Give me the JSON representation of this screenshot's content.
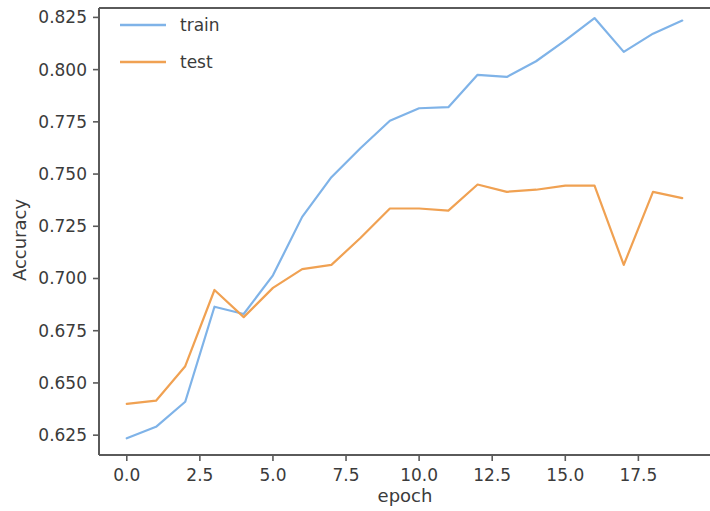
{
  "chart_data": {
    "type": "line",
    "title": "",
    "xlabel": "epoch",
    "ylabel": "Accuracy",
    "x": [
      0,
      1,
      2,
      3,
      4,
      5,
      6,
      7,
      8,
      9,
      10,
      11,
      12,
      13,
      14,
      15,
      16,
      17,
      18,
      19
    ],
    "series": [
      {
        "name": "train",
        "color": "#7fb3e8",
        "values": [
          0.6235,
          0.629,
          0.641,
          0.6865,
          0.683,
          0.7015,
          0.7295,
          0.7485,
          0.7625,
          0.7755,
          0.7815,
          0.782,
          0.7975,
          0.7965,
          0.804,
          0.814,
          0.8247,
          0.8085,
          0.8172,
          0.8235
        ]
      },
      {
        "name": "test",
        "color": "#f0a152",
        "values": [
          0.64,
          0.6415,
          0.658,
          0.6945,
          0.6815,
          0.6955,
          0.7045,
          0.7065,
          0.7195,
          0.7335,
          0.7335,
          0.7325,
          0.745,
          0.7415,
          0.7425,
          0.7445,
          0.7445,
          0.7065,
          0.7415,
          0.7385
        ]
      }
    ],
    "xlim": [
      -0.95,
      19.95
    ],
    "ylim": [
      0.6155,
      0.8295
    ],
    "xticks": [
      0.0,
      2.5,
      5.0,
      7.5,
      10.0,
      12.5,
      15.0,
      17.5
    ],
    "xticklabels": [
      "0.0",
      "2.5",
      "5.0",
      "7.5",
      "10.0",
      "12.5",
      "15.0",
      "17.5"
    ],
    "yticks": [
      0.625,
      0.65,
      0.675,
      0.7,
      0.725,
      0.75,
      0.775,
      0.8,
      0.825
    ],
    "yticklabels": [
      "0.625",
      "0.650",
      "0.675",
      "0.700",
      "0.725",
      "0.750",
      "0.775",
      "0.800",
      "0.825"
    ],
    "grid": false,
    "legend": {
      "position": "upper-left",
      "entries": [
        "train",
        "test"
      ]
    }
  }
}
